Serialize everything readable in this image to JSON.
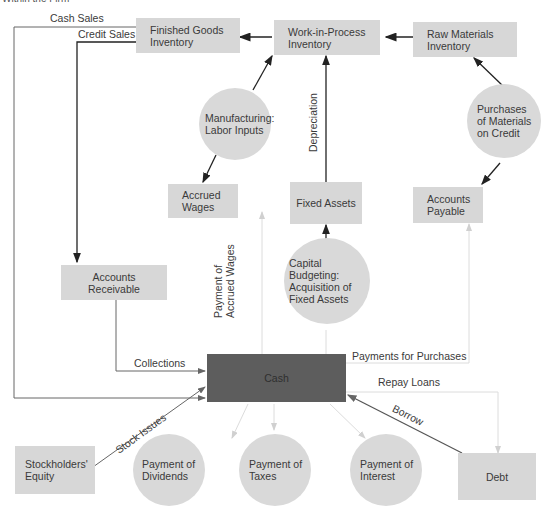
{
  "caption": "Within the Firm",
  "nodes": {
    "finished_goods": [
      "Finished Goods",
      "Inventory"
    ],
    "wip": [
      "Work-in-Process",
      "Inventory"
    ],
    "raw_materials": [
      "Raw Materials",
      "Inventory"
    ],
    "manufacturing": [
      "Manufacturing:",
      "Labor Inputs"
    ],
    "purchases_materials": [
      "Purchases",
      "of Materials",
      "on Credit"
    ],
    "accrued_wages": [
      "Accrued",
      "Wages"
    ],
    "fixed_assets": "Fixed Assets",
    "accounts_payable": [
      "Accounts",
      "Payable"
    ],
    "accounts_receivable": [
      "Accounts",
      "Receivable"
    ],
    "capital_budgeting": [
      "Capital Budgeting:",
      "Acquisition of",
      "Fixed Assets"
    ],
    "cash": "Cash",
    "stockholders_equity": [
      "Stockholders'",
      "Equity"
    ],
    "payment_dividends": [
      "Payment of",
      "Dividends"
    ],
    "payment_taxes": [
      "Payment of",
      "Taxes"
    ],
    "payment_interest": [
      "Payment of",
      "Interest"
    ],
    "debt": "Debt"
  },
  "flows": {
    "cash_sales": "Cash Sales",
    "credit_sales": "Credit Sales",
    "depreciation": "Depreciation",
    "payment_accrued_wages": [
      "Payment of",
      "Accrued Wages"
    ],
    "collections": "Collections",
    "payments_for_purchases": "Payments for Purchases",
    "repay_loans": "Repay Loans",
    "borrow": "Borrow",
    "stock_issues": "Stock Issues"
  },
  "colors": {
    "box_fill": "#d7d7d7",
    "circle_fill": "#d9d9d9",
    "cash_fill": "#5d5d5d",
    "arrow_dark": "#222222",
    "arrow_light": "#dcdcdc"
  }
}
